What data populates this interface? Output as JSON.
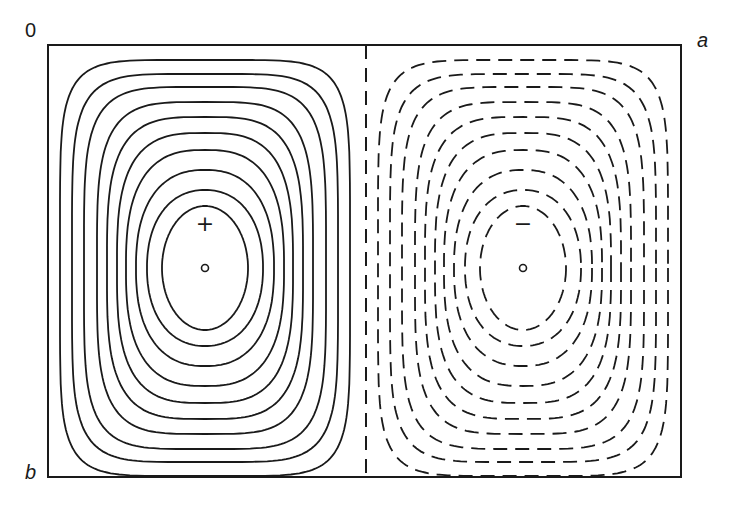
{
  "figure": {
    "type": "contour-diagram",
    "corner_labels": {
      "origin": "0",
      "x_extent": "a",
      "y_extent": "b"
    },
    "frame": {
      "x0": 48,
      "y0": 45,
      "x1": 681,
      "y1": 477
    },
    "divider": {
      "x": 366,
      "style": "dashed"
    },
    "colors": {
      "line": "#1a1a1a",
      "background": "#ffffff"
    },
    "cells": [
      {
        "name": "positive-cell",
        "sign_marker": "+",
        "line_style": "solid",
        "center": {
          "x": 205,
          "y": 268
        },
        "sign_marker_pos": {
          "x": 205,
          "y": 224
        },
        "center_marker": "o"
      },
      {
        "name": "negative-cell",
        "sign_marker": "−",
        "line_style": "dashed",
        "center": {
          "x": 523,
          "y": 268
        },
        "sign_marker_pos": {
          "x": 523,
          "y": 224
        },
        "center_marker": "o"
      }
    ],
    "contours": [
      {
        "rx": 145,
        "ry": 208,
        "n": 6.0
      },
      {
        "rx": 133,
        "ry": 194,
        "n": 5.2
      },
      {
        "rx": 121,
        "ry": 181,
        "n": 4.6
      },
      {
        "rx": 108,
        "ry": 166,
        "n": 4.0
      },
      {
        "rx": 98,
        "ry": 151,
        "n": 3.5
      },
      {
        "rx": 88,
        "ry": 135,
        "n": 3.1
      },
      {
        "rx": 79,
        "ry": 118,
        "n": 2.7
      },
      {
        "rx": 69,
        "ry": 98,
        "n": 2.4
      },
      {
        "rx": 58,
        "ry": 78,
        "n": 2.2
      },
      {
        "rx": 43,
        "ry": 62,
        "n": 2.0
      }
    ]
  }
}
